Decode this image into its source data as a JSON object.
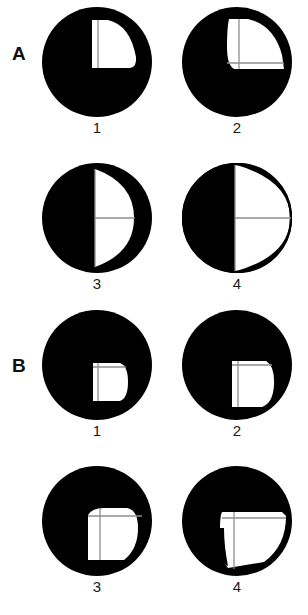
{
  "figure": {
    "title_visible": false,
    "background_color": "#ffffff",
    "ink_color": "#000000",
    "line_color": "#8a8a8a",
    "width": 308,
    "height": 615
  },
  "groups": [
    {
      "label": "A",
      "label_x": 12,
      "label_y": 55,
      "panels": [
        {
          "number": "1",
          "cx": 97,
          "cy": 62,
          "r": 55,
          "num_x": 82,
          "num_y": 127,
          "white_shape": "upper-right-quadrant-rounded",
          "lines": [
            "vertical-short"
          ],
          "description": "black disc with a white rounded quadrant in the upper right of center, one vertical grey line inside"
        },
        {
          "number": "2",
          "cx": 237,
          "cy": 62,
          "r": 55,
          "num_x": 222,
          "num_y": 127,
          "white_shape": "upper-right-quadrant-rounded-wide",
          "lines": [
            "vertical",
            "horizontal"
          ],
          "description": "black disc with a white rounded quadrant reaching the right edge, vertical and horizontal grey crosshair lines"
        },
        {
          "number": "3",
          "cx": 97,
          "cy": 218,
          "r": 55,
          "num_x": 82,
          "num_y": 283,
          "white_shape": "right-half-ellipse-inset",
          "lines": [
            "vertical",
            "horizontal"
          ],
          "description": "black disc with white right half shaped as an inset half ellipse, crosshair lines"
        },
        {
          "number": "4",
          "cx": 237,
          "cy": 218,
          "r": 55,
          "num_x": 222,
          "num_y": 283,
          "white_shape": "right-half-full",
          "lines": [
            "vertical",
            "horizontal"
          ],
          "description": "black disc with the entire right half white up to the rim, crosshair lines"
        }
      ]
    },
    {
      "label": "B",
      "label_x": 12,
      "label_y": 367,
      "panels": [
        {
          "number": "1",
          "cx": 97,
          "cy": 365,
          "r": 55,
          "num_x": 82,
          "num_y": 430,
          "white_shape": "small-d-shape",
          "lines": [
            "vertical-left",
            "horizontal-top"
          ],
          "description": "black disc with a small white D shape just below and right of centre"
        },
        {
          "number": "2",
          "cx": 237,
          "cy": 365,
          "r": 55,
          "num_x": 222,
          "num_y": 430,
          "white_shape": "medium-d-shape",
          "lines": [
            "vertical-left",
            "horizontal-top"
          ],
          "description": "black disc with a medium white D shape reaching lower right"
        },
        {
          "number": "3",
          "cx": 97,
          "cy": 521,
          "r": 55,
          "num_x": 82,
          "num_y": 586,
          "white_shape": "large-d-shape",
          "lines": [
            "vertical",
            "horizontal"
          ],
          "description": "black disc with a large white D shape and crosshair lines"
        },
        {
          "number": "4",
          "cx": 237,
          "cy": 521,
          "r": 55,
          "num_x": 222,
          "num_y": 586,
          "white_shape": "large-d-shape-notched",
          "lines": [
            "vertical",
            "horizontal"
          ],
          "description": "black disc with a large white region reaching the right rim and a notch on its left side"
        }
      ]
    }
  ]
}
